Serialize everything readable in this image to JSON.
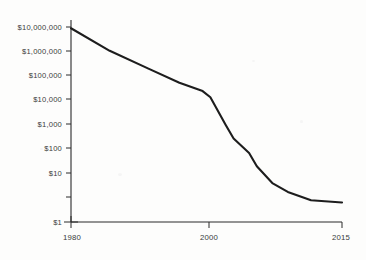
{
  "chart_data": {
    "type": "line",
    "title": "",
    "subtitle": "",
    "xlabel": "",
    "ylabel": "",
    "yscale": "log",
    "xscale": "linear",
    "grid": false,
    "legend": false,
    "xlim": [
      1980,
      2015
    ],
    "ylim": [
      1,
      10000000
    ],
    "x_tick_labels": [
      "1980",
      "2000",
      "2015"
    ],
    "x_tick_values": [
      1980,
      2000,
      2015
    ],
    "y_tick_labels": [
      "$10,000,000",
      "$1,000,000",
      "$100,000",
      "$10,000",
      "$1,000",
      "$100",
      "$10",
      "$1"
    ],
    "y_tick_values": [
      10000000,
      1000000,
      100000,
      10000,
      1000,
      100,
      10,
      1
    ],
    "series": [
      {
        "name": "cost",
        "x": [
          1980,
          1985,
          1990,
          1994,
          1997,
          1998,
          2000,
          2001,
          2003,
          2004,
          2006,
          2008,
          2011,
          2015
        ],
        "values": [
          9000000,
          1400000,
          320000,
          100000,
          50000,
          30000,
          3000,
          1000,
          300,
          100,
          25,
          12,
          6,
          5
        ]
      }
    ],
    "line_color": "#1d1d1d",
    "axis_color": "#2a2a2a",
    "background_color": "#fdfdfc"
  },
  "figure": {
    "width": 366,
    "height": 260,
    "plot_left": 71,
    "plot_right": 342,
    "plot_top": 20,
    "plot_bottom": 222
  }
}
